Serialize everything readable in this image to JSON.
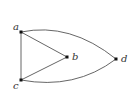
{
  "diagram": {
    "type": "graph",
    "vertices": [
      {
        "id": "a",
        "label": "a",
        "x": 21,
        "y": 32,
        "label_x": 13,
        "label_y": 30
      },
      {
        "id": "b",
        "label": "b",
        "x": 67,
        "y": 57,
        "label_x": 72,
        "label_y": 60
      },
      {
        "id": "c",
        "label": "c",
        "x": 21,
        "y": 80,
        "label_x": 13,
        "label_y": 89
      },
      {
        "id": "d",
        "label": "d",
        "x": 116,
        "y": 59,
        "label_x": 121,
        "label_y": 62
      }
    ],
    "edges": [
      {
        "from": "a",
        "to": "c",
        "shape": "straight"
      },
      {
        "from": "a",
        "to": "b",
        "shape": "straight"
      },
      {
        "from": "c",
        "to": "b",
        "shape": "straight"
      },
      {
        "from": "a",
        "to": "d",
        "shape": "curved"
      },
      {
        "from": "c",
        "to": "d",
        "shape": "curved"
      }
    ],
    "colors": {
      "edge": "#555555",
      "vertex": "#111111",
      "label": "#333333",
      "background": "#ffffff"
    }
  }
}
